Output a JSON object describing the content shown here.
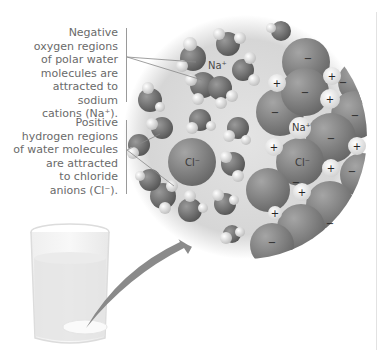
{
  "figure": {
    "captions": {
      "top": [
        "Negative",
        "oxygen regions",
        "of polar water",
        "molecules are",
        "attracted to sodium",
        "cations (Na⁺)."
      ],
      "bottom": [
        "Positive",
        "hydrogen regions",
        "of water molecules",
        "are attracted",
        "to chloride",
        "anions (Cl⁻)."
      ]
    },
    "ion_labels": {
      "sodium_hydrated": "Na⁺",
      "chloride_hydrated": "Cl⁻",
      "sodium_crystal": "Na⁺",
      "chloride_crystal": "Cl⁻"
    },
    "charge_symbols": {
      "plus": "+",
      "minus": "−"
    },
    "colors": {
      "circle_bg": "#d9d9d9",
      "oxygen": "#6f6f6f",
      "hydrogen": "#e6e6e6",
      "chloride": "#7a7a7a",
      "sodium": "#ececec",
      "arrow": "#8a8a8a",
      "caption_text": "#6a6a6a"
    }
  }
}
